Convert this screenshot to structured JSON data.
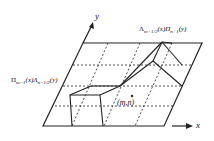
{
  "diagram": {
    "axis_x_label": "x",
    "axis_y_label": "y",
    "label_top_right": "Λ_{m+1/2}(x)Π_{n+1}(y)",
    "label_left": "Π_{m−1}(x)Λ_{n−1/2}(y)",
    "label_center": "(m,n)",
    "top_right_parts": {
      "a": "Λ",
      "a_sub": "m+1/2",
      "b": "(x)Π",
      "b_sub": "n+1",
      "c": "(y)"
    },
    "left_parts": {
      "a": "Π",
      "a_sub": "m−1",
      "b": "(x)Λ",
      "b_sub": "n−1/2",
      "c": "(y)"
    },
    "stroke_color": "#222222"
  }
}
